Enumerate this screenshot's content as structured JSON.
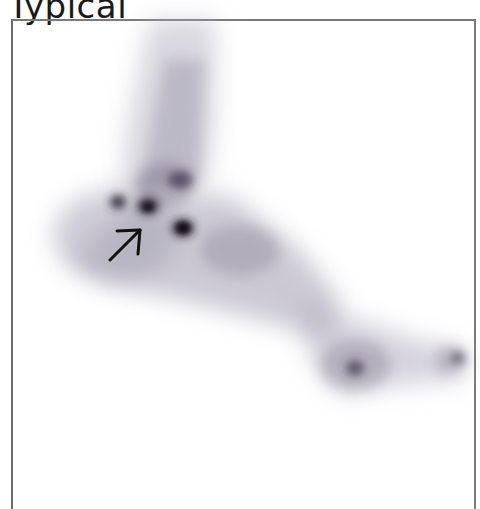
{
  "figure": {
    "title": "Typical",
    "image_description": "bone-scan-foot-lateral-view",
    "annotation": "arrow-pointing-up-right",
    "colors": {
      "frame": "#7a7a7a",
      "uptake_light": "#c9c6d2",
      "uptake_dark": "#2a2530",
      "arrow": "#111111"
    }
  }
}
